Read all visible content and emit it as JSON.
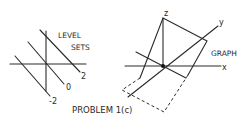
{
  "caption": "PROBLEM 1(c)",
  "level_sets": {
    "title_line1": "LEVEL",
    "title_line2": "SETS",
    "labels": [
      "2",
      "0",
      "-2"
    ]
  },
  "graph": {
    "title": "GRAPH",
    "axes": {
      "x": "x",
      "y": "y",
      "z": "z"
    }
  }
}
